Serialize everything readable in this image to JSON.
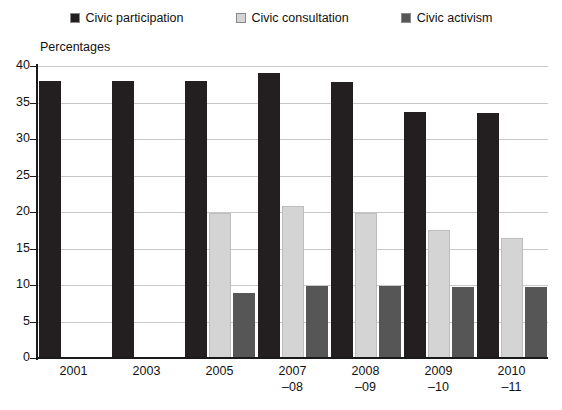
{
  "chart_data": {
    "type": "bar",
    "title": "",
    "ylabel": "Percentages",
    "xlabel": "",
    "ylim": [
      0,
      40
    ],
    "ytick_step": 5,
    "yticks": [
      40,
      35,
      30,
      25,
      20,
      15,
      10,
      5,
      0
    ],
    "grid": true,
    "legend_position": "top",
    "categories": [
      "2001",
      "2003",
      "2005",
      "2007–08",
      "2008–09",
      "2009–10",
      "2010–11"
    ],
    "category_lines": [
      [
        "2001",
        ""
      ],
      [
        "2003",
        ""
      ],
      [
        "2005",
        ""
      ],
      [
        "2007",
        "–08"
      ],
      [
        "2008",
        "–09"
      ],
      [
        "2009",
        "–10"
      ],
      [
        "2010",
        "–11"
      ]
    ],
    "series": [
      {
        "name": "Civic participation",
        "color": "#231f20",
        "values": [
          38.0,
          38.0,
          38.0,
          39.0,
          37.8,
          33.7,
          33.6
        ]
      },
      {
        "name": "Civic consultation",
        "color": "#d4d4d4",
        "values": [
          null,
          null,
          19.9,
          20.8,
          19.8,
          17.6,
          16.5
        ]
      },
      {
        "name": "Civic activism",
        "color": "#565656",
        "values": [
          null,
          null,
          8.9,
          9.8,
          9.8,
          9.7,
          9.7
        ]
      }
    ]
  },
  "legend": {
    "items": [
      {
        "label": "Civic participation",
        "swatch": "#231f20",
        "icon": "legend-square-icon"
      },
      {
        "label": "Civic consultation",
        "swatch": "#d4d4d4",
        "icon": "legend-square-icon"
      },
      {
        "label": "Civic activism",
        "swatch": "#565656",
        "icon": "legend-square-icon"
      }
    ]
  }
}
